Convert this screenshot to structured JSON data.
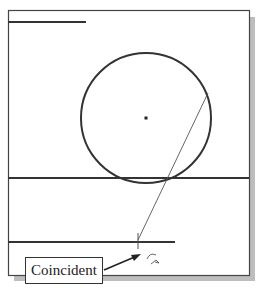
{
  "diagram": {
    "colors": {
      "frame": "#444444",
      "shadow": "#bbbbbb",
      "geometry": "#333333",
      "construction_line": "#555555",
      "background": "#ffffff"
    },
    "frame": {
      "x": 8,
      "y": 10,
      "width": 241,
      "height": 265
    },
    "elements": [
      {
        "type": "line",
        "name": "top-left-line",
        "x1": 8,
        "y1": 22,
        "x2": 86,
        "y2": 22
      },
      {
        "type": "circle",
        "name": "circle",
        "cx": 146,
        "cy": 118,
        "r": 65
      },
      {
        "type": "point",
        "name": "circle-center-point",
        "x": 146,
        "y": 118
      },
      {
        "type": "line",
        "name": "horizontal-line-full",
        "x1": 8,
        "y1": 178,
        "x2": 249,
        "y2": 178
      },
      {
        "type": "line",
        "name": "horizontal-line-short",
        "x1": 8,
        "y1": 242,
        "x2": 175,
        "y2": 242
      },
      {
        "type": "line",
        "name": "diagonal-sketch-line",
        "x1": 208,
        "y1": 93,
        "x2": 138,
        "y2": 240
      }
    ],
    "callout": {
      "label": "Coincident"
    }
  }
}
